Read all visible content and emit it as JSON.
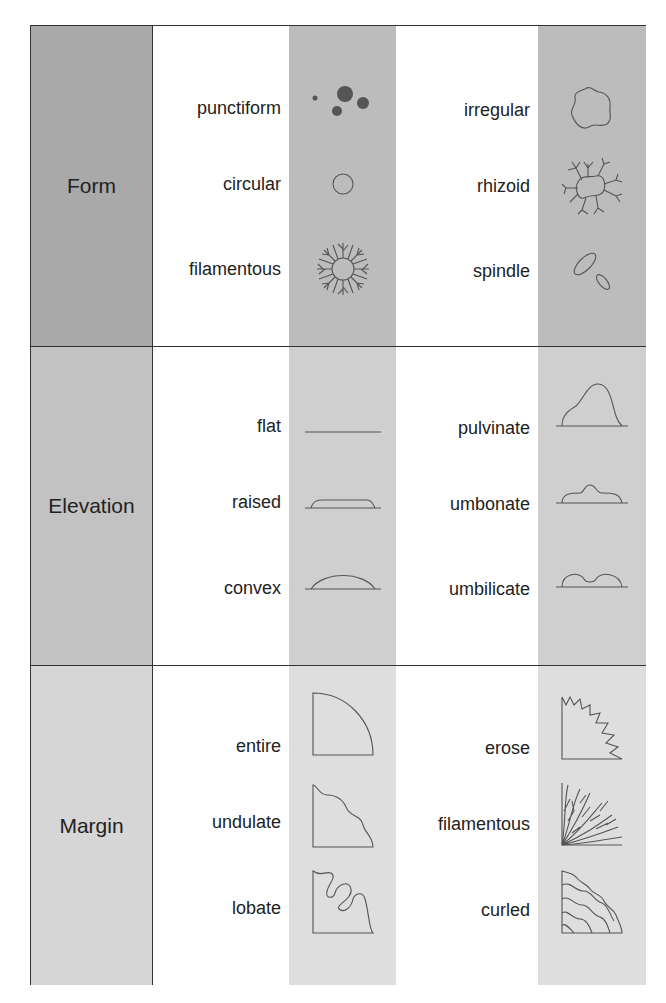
{
  "sections": [
    {
      "name": "Form",
      "left": [
        {
          "label": "punctiform",
          "icon": "punctiform-dots"
        },
        {
          "label": "circular",
          "icon": "circle-outline"
        },
        {
          "label": "filamentous",
          "icon": "filamentous-ring"
        }
      ],
      "right": [
        {
          "label": "irregular",
          "icon": "irregular-blob"
        },
        {
          "label": "rhizoid",
          "icon": "rhizoid-branching"
        },
        {
          "label": "spindle",
          "icon": "spindle-ovals"
        }
      ]
    },
    {
      "name": "Elevation",
      "left": [
        {
          "label": "flat",
          "icon": "flat-line"
        },
        {
          "label": "raised",
          "icon": "raised-profile"
        },
        {
          "label": "convex",
          "icon": "convex-profile"
        }
      ],
      "right": [
        {
          "label": "pulvinate",
          "icon": "pulvinate-profile"
        },
        {
          "label": "umbonate",
          "icon": "umbonate-profile"
        },
        {
          "label": "umbilicate",
          "icon": "umbilicate-profile"
        }
      ]
    },
    {
      "name": "Margin",
      "left": [
        {
          "label": "entire",
          "icon": "entire-quadrant"
        },
        {
          "label": "undulate",
          "icon": "undulate-quadrant"
        },
        {
          "label": "lobate",
          "icon": "lobate-quadrant"
        }
      ],
      "right": [
        {
          "label": "erose",
          "icon": "erose-quadrant"
        },
        {
          "label": "filamentous",
          "icon": "filamentous-quadrant"
        },
        {
          "label": "curled",
          "icon": "curled-quadrant"
        }
      ]
    }
  ]
}
